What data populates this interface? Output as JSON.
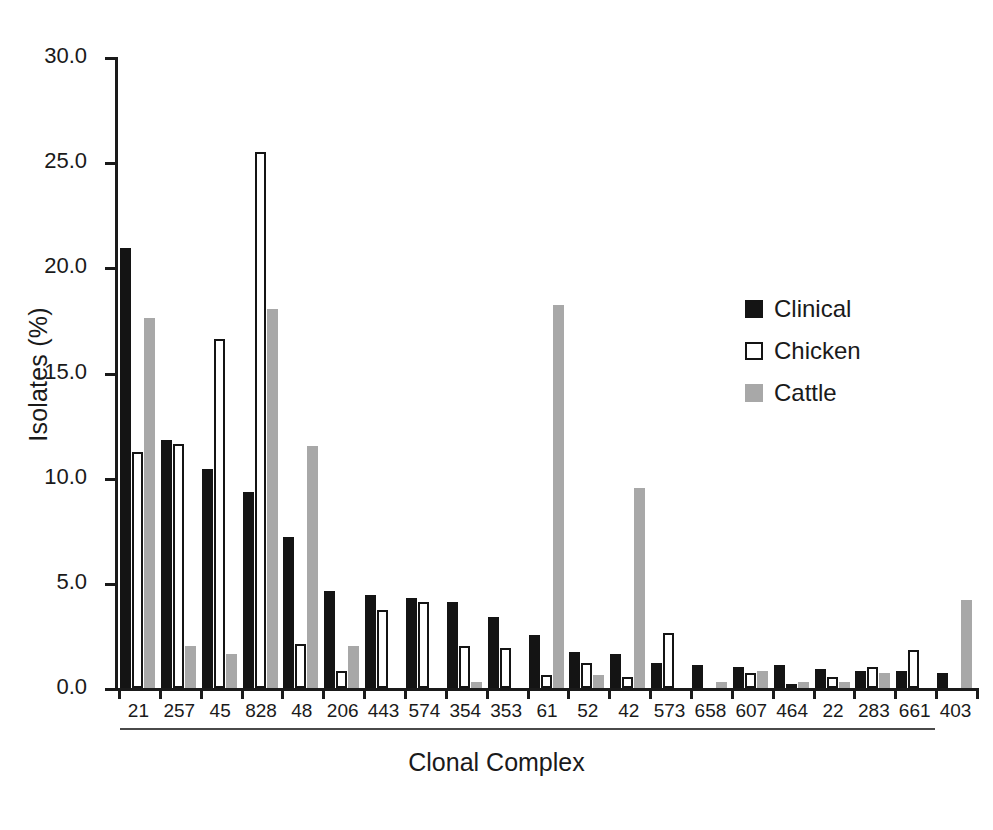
{
  "chart_data": {
    "type": "bar",
    "title": "",
    "xlabel": "Clonal Complex",
    "ylabel": "Isolates (%)",
    "ylim": [
      0.0,
      30.0
    ],
    "ytick_labels": [
      "0.0",
      "5.0",
      "10.0",
      "15.0",
      "20.0",
      "25.0",
      "30.0"
    ],
    "ytick_values": [
      0.0,
      5.0,
      10.0,
      15.0,
      20.0,
      25.0,
      30.0
    ],
    "grid": false,
    "legend_position": "upper-right-inside",
    "categories": [
      "21",
      "257",
      "45",
      "828",
      "48",
      "206",
      "443",
      "574",
      "354",
      "353",
      "61",
      "52",
      "42",
      "573",
      "658",
      "607",
      "464",
      "22",
      "283",
      "661",
      "403"
    ],
    "series": [
      {
        "name": "Clinical",
        "color": "#141414",
        "values": [
          20.9,
          11.8,
          10.4,
          9.3,
          7.2,
          4.6,
          4.4,
          4.3,
          4.1,
          3.4,
          2.5,
          1.7,
          1.6,
          1.2,
          1.1,
          1.0,
          1.1,
          0.9,
          0.8,
          0.8,
          0.7
        ]
      },
      {
        "name": "Chicken",
        "color": "#ffffff",
        "values": [
          11.2,
          11.6,
          16.6,
          25.5,
          2.1,
          0.8,
          3.7,
          4.1,
          2.0,
          1.9,
          0.6,
          1.2,
          0.5,
          2.6,
          0.0,
          0.7,
          0.2,
          0.5,
          1.0,
          1.8,
          0.0
        ]
      },
      {
        "name": "Cattle",
        "color": "#a8a8a8",
        "values": [
          17.6,
          2.0,
          1.6,
          18.0,
          11.5,
          2.0,
          0.0,
          0.0,
          0.3,
          0.0,
          18.2,
          0.6,
          9.5,
          0.0,
          0.3,
          0.8,
          0.3,
          0.3,
          0.7,
          0.0,
          4.2
        ]
      }
    ]
  },
  "legend": {
    "items": [
      {
        "label": "Clinical",
        "swatch": "filled-black-square"
      },
      {
        "label": "Chicken",
        "swatch": "outlined-white-square"
      },
      {
        "label": "Cattle",
        "swatch": "filled-gray-square"
      }
    ]
  }
}
